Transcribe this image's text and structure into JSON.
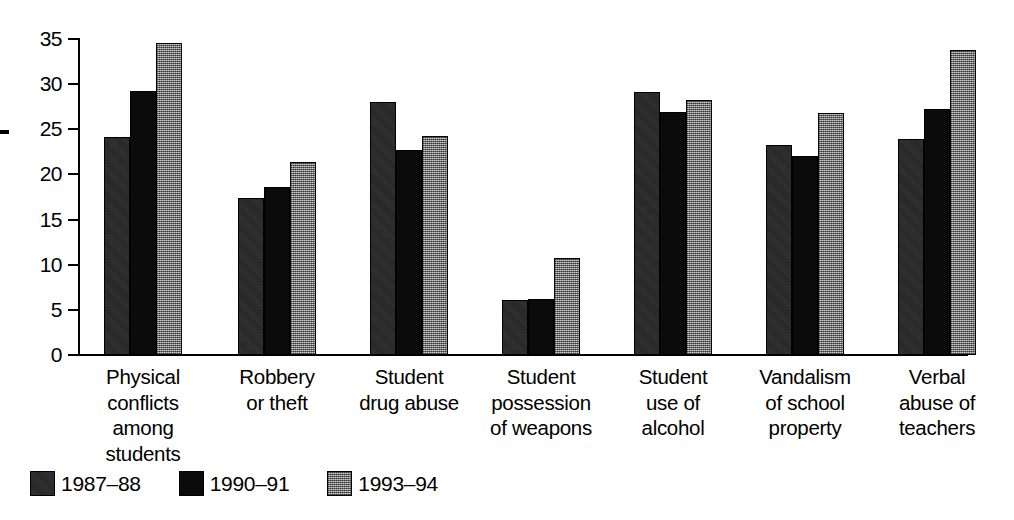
{
  "chart_data": {
    "type": "bar",
    "title": "",
    "subtitle": "",
    "xlabel": "",
    "ylabel": "",
    "ylim": [
      0,
      35
    ],
    "yticks": [
      0,
      5,
      10,
      15,
      20,
      25,
      30,
      35
    ],
    "ytick_labels": [
      "0",
      "5",
      "10",
      "15",
      "20",
      "25",
      "30",
      "35"
    ],
    "grid": false,
    "legend_position": "bottom-left",
    "categories": [
      "Physical conflicts among students",
      "Robbery or theft",
      "Student drug abuse",
      "Student possession of weapons",
      "Student use of alcohol",
      "Vandalism of school property",
      "Verbal abuse of teachers"
    ],
    "category_label_lines": [
      [
        "Physical",
        "conflicts",
        "among",
        "students"
      ],
      [
        "Robbery",
        "or theft"
      ],
      [
        "Student",
        "drug abuse"
      ],
      [
        "Student",
        "possession",
        "of weapons"
      ],
      [
        "Student",
        "use of",
        "alcohol"
      ],
      [
        "Vandalism",
        "of school",
        "property"
      ],
      [
        "Verbal",
        "abuse of",
        "teachers"
      ]
    ],
    "series": [
      {
        "name": "1987–88",
        "color": "#262626",
        "values": [
          24.2,
          17.4,
          28.0,
          6.1,
          29.1,
          23.3,
          23.9
        ]
      },
      {
        "name": "1990–91",
        "color": "#0b0b0b",
        "values": [
          29.2,
          18.6,
          22.7,
          6.2,
          26.9,
          22.0,
          27.2
        ]
      },
      {
        "name": "1993–94",
        "color": "#8a8a8a",
        "values": [
          34.6,
          21.4,
          24.3,
          10.8,
          28.3,
          26.8,
          33.8
        ]
      }
    ]
  },
  "legend": {
    "items": [
      {
        "label": "1987–88",
        "swatch": "dark-gray"
      },
      {
        "label": "1990–91",
        "swatch": "black"
      },
      {
        "label": "1993–94",
        "swatch": "light-gray"
      }
    ]
  }
}
